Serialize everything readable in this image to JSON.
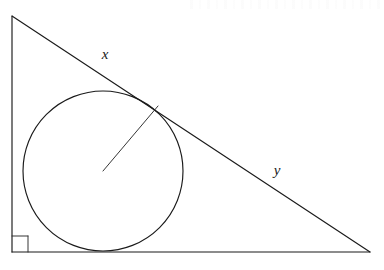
{
  "figure": {
    "title": "right-triangle-with-inscribed-circle",
    "background_color": "#ffffff",
    "stroke_color": "#1a1a1a",
    "triangle": {
      "name": "right-triangle",
      "vertices": {
        "apex": [
          12,
          16
        ],
        "right_angle": [
          12,
          252
        ],
        "base_right": [
          370,
          252
        ]
      },
      "right_angle_marker": {
        "x": 12,
        "y": 236,
        "size": 16
      }
    },
    "circle": {
      "name": "inscribed-circle",
      "center": [
        103,
        171
      ],
      "radius": 80
    },
    "radius_segment": {
      "name": "radius-to-tangent-point",
      "from": [
        103,
        171
      ],
      "to": [
        158,
        106
      ]
    },
    "labels": {
      "hypotenuse_upper": {
        "text": "x",
        "x": 105,
        "y": 56
      },
      "hypotenuse_lower": {
        "text": "y",
        "x": 277,
        "y": 172
      }
    }
  }
}
